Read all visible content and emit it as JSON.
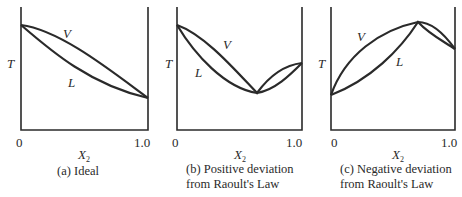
{
  "panels": [
    {
      "id": "a",
      "caption_line1": "(a) Ideal",
      "caption_line2": "",
      "y_axis_label": "T",
      "x_axis_label": "X",
      "x_axis_subscript": "2",
      "x_tick_left": "0",
      "x_tick_right": "1.0",
      "curve_upper_label": "V",
      "curve_lower_label": "L"
    },
    {
      "id": "b",
      "caption_line1": "(b) Positive deviation",
      "caption_line2": "from Raoult's Law",
      "y_axis_label": "T",
      "x_axis_label": "X",
      "x_axis_subscript": "2",
      "x_tick_left": "0",
      "x_tick_right": "1.0",
      "curve_upper_label": "V",
      "curve_lower_label": "L"
    },
    {
      "id": "c",
      "caption_line1": "(c) Negative deviation",
      "caption_line2": "from Raoult's Law",
      "y_axis_label": "T",
      "x_axis_label": "X",
      "x_axis_subscript": "2",
      "x_tick_left": "0",
      "x_tick_right": "1.0",
      "curve_upper_label": "V",
      "curve_lower_label": "L"
    }
  ],
  "colors": {
    "line": "#2a2a2a",
    "background": "#ffffff"
  }
}
